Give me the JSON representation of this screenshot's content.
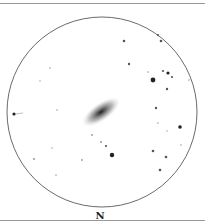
{
  "orientation_label": "N",
  "field": {
    "cx": 102,
    "cy": 112,
    "r": 95
  },
  "galaxy": {
    "cx": 101,
    "cy": 112,
    "rx": 22,
    "ry": 9,
    "angle": -35
  },
  "stars": [
    [
      124,
      41,
      1.3
    ],
    [
      158,
      35,
      1.1
    ],
    [
      161,
      41,
      1.3
    ],
    [
      129,
      64,
      1.2
    ],
    [
      50,
      68,
      0.8
    ],
    [
      40,
      81,
      0.7
    ],
    [
      148,
      72,
      0.8
    ],
    [
      163,
      71,
      1.1
    ],
    [
      168,
      73,
      1.6
    ],
    [
      172,
      77,
      1.1
    ],
    [
      153,
      80,
      2.4
    ],
    [
      189,
      80,
      0.8
    ],
    [
      167,
      89,
      1.2
    ],
    [
      57,
      110,
      0.8
    ],
    [
      156,
      108,
      1.2
    ],
    [
      158,
      123,
      0.8
    ],
    [
      180,
      127,
      1.8
    ],
    [
      167,
      131,
      0.7
    ],
    [
      92,
      135,
      0.9
    ],
    [
      101,
      142,
      1
    ],
    [
      106,
      146,
      1.1
    ],
    [
      52,
      148,
      0.7
    ],
    [
      112,
      155,
      2.2
    ],
    [
      153,
      151,
      1.3
    ],
    [
      166,
      157,
      1.3
    ],
    [
      181,
      145,
      0.8
    ],
    [
      34,
      159,
      1
    ],
    [
      82,
      160,
      0.9
    ],
    [
      160,
      170,
      1.3
    ],
    [
      56,
      175,
      0.8
    ],
    [
      14,
      114,
      1.6
    ]
  ]
}
